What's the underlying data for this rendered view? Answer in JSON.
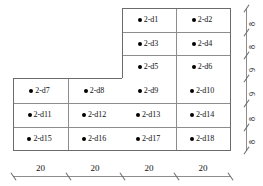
{
  "figure": {
    "title": "",
    "type": "stepped-grid-layout-diagram",
    "cells": [
      {
        "id": "c1",
        "label": "2-d1",
        "row": 0,
        "col": 2
      },
      {
        "id": "c2",
        "label": "2-d2",
        "row": 0,
        "col": 3
      },
      {
        "id": "c3",
        "label": "2-d3",
        "row": 1,
        "col": 2
      },
      {
        "id": "c4",
        "label": "2-d4",
        "row": 1,
        "col": 3
      },
      {
        "id": "c5",
        "label": "2-d5",
        "row": 2,
        "col": 2
      },
      {
        "id": "c6",
        "label": "2-d6",
        "row": 2,
        "col": 3
      },
      {
        "id": "c7",
        "label": "2-d7",
        "row": 3,
        "col": 0
      },
      {
        "id": "c8",
        "label": "2-d8",
        "row": 3,
        "col": 1
      },
      {
        "id": "c9",
        "label": "2-d9",
        "row": 3,
        "col": 2
      },
      {
        "id": "c10",
        "label": "2-d10",
        "row": 3,
        "col": 3
      },
      {
        "id": "c11",
        "label": "2-d11",
        "row": 4,
        "col": 0
      },
      {
        "id": "c12",
        "label": "2-d12",
        "row": 4,
        "col": 1
      },
      {
        "id": "c13",
        "label": "2-d13",
        "row": 4,
        "col": 2
      },
      {
        "id": "c14",
        "label": "2-d14",
        "row": 4,
        "col": 3
      },
      {
        "id": "c15",
        "label": "2-d15",
        "row": 5,
        "col": 0
      },
      {
        "id": "c16",
        "label": "2-d16",
        "row": 5,
        "col": 1
      },
      {
        "id": "c17",
        "label": "2-d17",
        "row": 5,
        "col": 2
      },
      {
        "id": "c18",
        "label": "2-d18",
        "row": 5,
        "col": 3
      }
    ],
    "vertical_dimensions": [
      "8",
      "8",
      "9",
      "9",
      "8",
      "8"
    ],
    "horizontal_dimensions": [
      "20",
      "20",
      "20",
      "20"
    ],
    "colors": {
      "node": "#000000",
      "gridline": "#8d8d8d",
      "outline": "#6b6b6b",
      "text": "#111111",
      "background": "#ffffff"
    }
  }
}
